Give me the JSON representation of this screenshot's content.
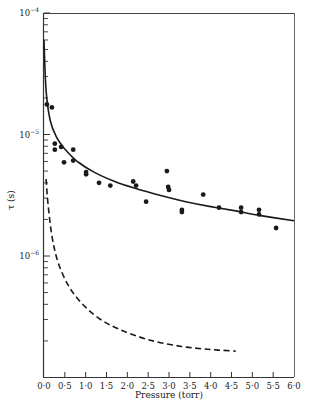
{
  "chart_data": {
    "type": "scatter",
    "title": "",
    "xlabel": "Pressure (torr)",
    "ylabel": "τ (s)",
    "xlim": [
      0.0,
      6.0
    ],
    "ylim": [
      1.5e-07,
      0.0001
    ],
    "yscale": "log",
    "grid": false,
    "legend": null,
    "x_ticks": [
      "0·0",
      "0·5",
      "1·0",
      "1·5",
      "2·0",
      "2·5",
      "3·0",
      "3·5",
      "4·0",
      "4·5",
      "5·0",
      "5·5",
      "6·0"
    ],
    "x_tick_values": [
      0.0,
      0.5,
      1.0,
      1.5,
      2.0,
      2.5,
      3.0,
      3.5,
      4.0,
      4.5,
      5.0,
      5.5,
      6.0
    ],
    "y_ticks": [
      {
        "base": "10",
        "exp": "−4",
        "value": 0.0001
      },
      {
        "base": "10",
        "exp": "−5",
        "value": 1e-05
      },
      {
        "base": "10",
        "exp": "−6",
        "value": 1e-06
      }
    ],
    "series": [
      {
        "name": "measured",
        "style": "points",
        "points": [
          [
            0.07,
            1.77e-05
          ],
          [
            0.19,
            1.67e-05
          ],
          [
            0.26,
            8.4e-06
          ],
          [
            0.26,
            7.5e-06
          ],
          [
            0.41,
            7.9e-06
          ],
          [
            0.48,
            5.9e-06
          ],
          [
            0.7,
            7.5e-06
          ],
          [
            0.7,
            6.1e-06
          ],
          [
            1.01,
            4.9e-06
          ],
          [
            1.01,
            4.7e-06
          ],
          [
            1.32,
            4e-06
          ],
          [
            1.59,
            3.8e-06
          ],
          [
            2.14,
            4.1e-06
          ],
          [
            2.21,
            3.8e-06
          ],
          [
            2.45,
            2.8e-06
          ],
          [
            2.95,
            5e-06
          ],
          [
            2.98,
            3.7e-06
          ],
          [
            3.0,
            3.5e-06
          ],
          [
            3.31,
            2.4e-06
          ],
          [
            3.31,
            2.3e-06
          ],
          [
            3.82,
            3.2e-06
          ],
          [
            4.2,
            2.5e-06
          ],
          [
            4.73,
            2.5e-06
          ],
          [
            4.73,
            2.3e-06
          ],
          [
            5.16,
            2.4e-06
          ],
          [
            5.16,
            2.2e-06
          ],
          [
            5.57,
            1.7e-06
          ]
        ]
      },
      {
        "name": "fit",
        "style": "solid",
        "points": [
          [
            0.0,
            6e-05
          ],
          [
            0.05,
            2.3e-05
          ],
          [
            0.15,
            1.3e-05
          ],
          [
            0.3,
            9.5e-06
          ],
          [
            0.5,
            7.6e-06
          ],
          [
            0.8,
            6e-06
          ],
          [
            1.2,
            4.9e-06
          ],
          [
            1.7,
            4.1e-06
          ],
          [
            2.2,
            3.6e-06
          ],
          [
            2.8,
            3.15e-06
          ],
          [
            3.4,
            2.8e-06
          ],
          [
            4.0,
            2.55e-06
          ],
          [
            4.6,
            2.35e-06
          ],
          [
            5.2,
            2.15e-06
          ],
          [
            6.0,
            1.95e-06
          ]
        ]
      },
      {
        "name": "calculated",
        "style": "dashed",
        "points": [
          [
            0.05,
            4.3e-06
          ],
          [
            0.1,
            2.6e-06
          ],
          [
            0.2,
            1.4e-06
          ],
          [
            0.35,
            8.6e-07
          ],
          [
            0.6,
            5.6e-07
          ],
          [
            0.9,
            4.1e-07
          ],
          [
            1.3,
            3.1e-07
          ],
          [
            1.8,
            2.5e-07
          ],
          [
            2.5,
            2.05e-07
          ],
          [
            3.3,
            1.8e-07
          ],
          [
            4.0,
            1.7e-07
          ],
          [
            4.6,
            1.65e-07
          ]
        ]
      }
    ]
  },
  "layout": {
    "plot": {
      "left": 44,
      "right": 294,
      "top": 13,
      "bottom": 377
    },
    "colors": {
      "ink": "#1a1a1a",
      "frame": "#555555",
      "background": "#ffffff"
    }
  }
}
